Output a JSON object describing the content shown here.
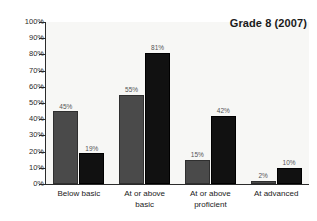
{
  "chart_data": {
    "type": "bar",
    "title": "Grade 8 (2007)",
    "xlabel": "",
    "ylabel": "",
    "ylim": [
      0,
      100
    ],
    "grid": false,
    "legend": "none",
    "categories": [
      "Below basic",
      "At or above basic",
      "At or above proficient",
      "At advanced"
    ],
    "category_lines": [
      [
        "Below basic"
      ],
      [
        "At or above",
        "basic"
      ],
      [
        "At or above",
        "proficient"
      ],
      [
        "At advanced"
      ]
    ],
    "series": [
      {
        "name": "gray",
        "color": "#4a4a4a",
        "values": [
          45,
          55,
          15,
          2
        ],
        "value_labels": [
          "45%",
          "55%",
          "15%",
          "2%"
        ]
      },
      {
        "name": "black",
        "color": "#111111",
        "values": [
          19,
          81,
          42,
          10
        ],
        "value_labels": [
          "19%",
          "81%",
          "42%",
          "10%"
        ]
      }
    ],
    "y_ticks": [
      0,
      10,
      20,
      30,
      40,
      50,
      60,
      70,
      80,
      90,
      100
    ],
    "y_tick_labels": [
      "0%",
      "10%",
      "20%",
      "30%",
      "40%",
      "50%",
      "60%",
      "70%",
      "80%",
      "90%",
      "100%"
    ],
    "colors": {
      "page_background": "#ffffff",
      "plot_background": "#f7f7f5",
      "axis": "#2b2b2b",
      "title_text": "#1a1a1a",
      "value_label_text": "#555555",
      "category_text": "#1a1a1a"
    }
  }
}
